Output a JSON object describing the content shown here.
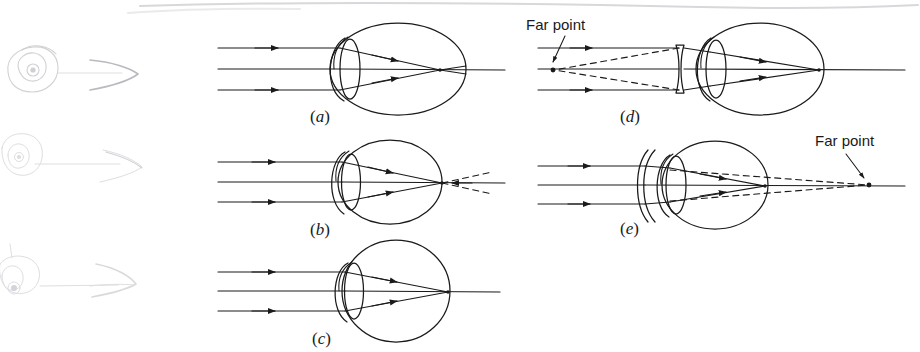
{
  "figure": {
    "kind": "optics-diagram",
    "background_color": "#ffffff",
    "ink_color": "#1a1a1a",
    "ghost_color": "#c9c9cf"
  },
  "panels": [
    {
      "id": "a",
      "label_open": "(",
      "label_letter": "a",
      "label_close": ")",
      "condition": "myopia-uncorrected",
      "eye_shape": "elongated",
      "corrective_lens": "none",
      "focus_location": "in front of retina",
      "ray_count": 3,
      "has_dashed_rays": false
    },
    {
      "id": "b",
      "label_open": "(",
      "label_letter": "b",
      "label_close": ")",
      "condition": "hyperopia-uncorrected",
      "eye_shape": "shortened",
      "corrective_lens": "none",
      "focus_location": "behind retina",
      "ray_count": 3,
      "has_dashed_rays": true
    },
    {
      "id": "c",
      "label_open": "(",
      "label_letter": "c",
      "label_close": ")",
      "condition": "normal-vision",
      "eye_shape": "round",
      "corrective_lens": "none",
      "focus_location": "on retina",
      "ray_count": 3,
      "has_dashed_rays": false
    },
    {
      "id": "d",
      "label_open": "(",
      "label_letter": "d",
      "label_close": ")",
      "condition": "myopia-corrected",
      "eye_shape": "elongated",
      "corrective_lens": "diverging",
      "focus_location": "on retina",
      "ray_count": 3,
      "has_dashed_rays": true
    },
    {
      "id": "e",
      "label_open": "(",
      "label_letter": "e",
      "label_close": ")",
      "condition": "hyperopia-corrected",
      "eye_shape": "shortened",
      "corrective_lens": "converging",
      "focus_location": "on retina",
      "ray_count": 3,
      "has_dashed_rays": true
    }
  ],
  "annotations": {
    "far_point_d": "Far point",
    "far_point_e": "Far point"
  },
  "ghost_sketches": [
    {
      "id": "ghost-1",
      "description": "faint eye with arrow"
    },
    {
      "id": "ghost-2",
      "description": "faint eye with arrow"
    },
    {
      "id": "ghost-3",
      "description": "faint eye with arrow"
    }
  ]
}
